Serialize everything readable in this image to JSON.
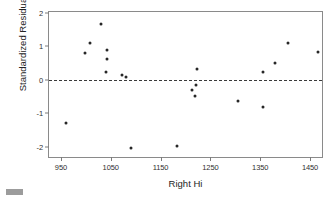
{
  "chart_data": {
    "type": "scatter",
    "title": "",
    "xlabel": "Right Hi",
    "ylabel": "Standardized Residual",
    "xlim": [
      926,
      1474
    ],
    "ylim": [
      -2.31,
      2.03
    ],
    "xticks": [
      950,
      1050,
      1150,
      1250,
      1350,
      1450
    ],
    "yticks": [
      2,
      1,
      0,
      -1,
      -2
    ],
    "xtick_labels": [
      "950",
      "1050",
      "1150",
      "1250",
      "1350",
      "1450"
    ],
    "ytick_labels": [
      "2",
      "1",
      "0",
      "-1",
      "-2"
    ],
    "grid": false,
    "legend": null,
    "reference_lines": [
      {
        "name": "zero-residual-line",
        "axis": "y",
        "value": 0,
        "style": "dashed"
      }
    ],
    "marker": {
      "shape": "circle",
      "color": "#272727",
      "size": 3
    },
    "points": [
      {
        "x": 960,
        "y": -1.29
      },
      {
        "x": 998,
        "y": 0.8
      },
      {
        "x": 1008,
        "y": 1.09
      },
      {
        "x": 1030,
        "y": 1.66
      },
      {
        "x": 1040,
        "y": 0.23
      },
      {
        "x": 1042,
        "y": 0.89
      },
      {
        "x": 1042,
        "y": 0.63
      },
      {
        "x": 1072,
        "y": 0.14
      },
      {
        "x": 1081,
        "y": 0.09
      },
      {
        "x": 1090,
        "y": -2.03
      },
      {
        "x": 1183,
        "y": -1.97
      },
      {
        "x": 1213,
        "y": -0.29
      },
      {
        "x": 1219,
        "y": -0.49
      },
      {
        "x": 1221,
        "y": -0.14
      },
      {
        "x": 1223,
        "y": 0.31
      },
      {
        "x": 1305,
        "y": -0.63
      },
      {
        "x": 1356,
        "y": -0.8
      },
      {
        "x": 1356,
        "y": 0.23
      },
      {
        "x": 1380,
        "y": 0.49
      },
      {
        "x": 1406,
        "y": 1.09
      },
      {
        "x": 1466,
        "y": 0.83
      }
    ]
  }
}
